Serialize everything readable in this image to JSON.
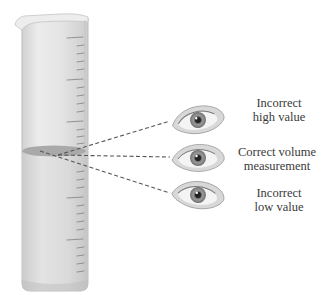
{
  "figure": {
    "cylinder": {
      "glass_color": "#e6e6e6",
      "glass_shade_color": "#cfcfcf",
      "graduation_color": "#8a8a8a",
      "liquid_surface_color": "#a9a9a9"
    },
    "sight_lines": {
      "style": "dashed",
      "color": "#555555"
    },
    "eyes": [
      {
        "position": "above meniscus",
        "label_line1": "Incorrect",
        "label_line2": "high value"
      },
      {
        "position": "level with meniscus",
        "label_line1": "Correct volume",
        "label_line2": "measurement"
      },
      {
        "position": "below meniscus",
        "label_line1": "Incorrect",
        "label_line2": "low value"
      }
    ]
  }
}
